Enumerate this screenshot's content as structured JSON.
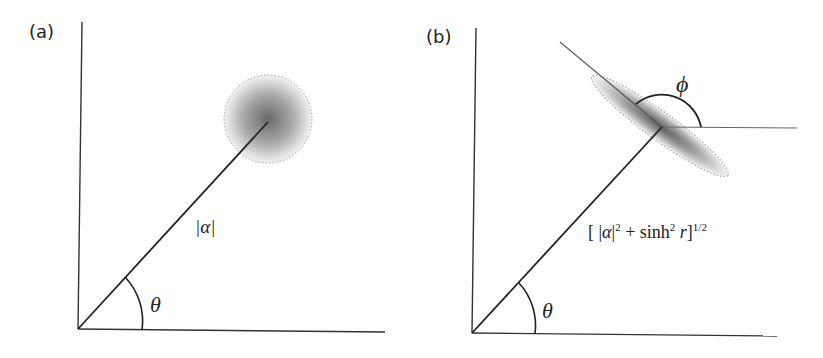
{
  "panels": [
    {
      "id": "a",
      "label": "(a)",
      "vector_label": "|α|",
      "angle_label": "θ",
      "state": "coherent state",
      "uncertainty_shape": "circle"
    },
    {
      "id": "b",
      "label": "(b)",
      "vector_label_parts": {
        "open": "[ |",
        "alpha": "α",
        "close_abs": "|",
        "sup2a": "2",
        "plus": " + sinh",
        "sup2b": "2",
        "r": " r",
        "close": "]",
        "sup_half": "1/2"
      },
      "vector_label_full": "[|α|² + sinh² r]^(1/2)",
      "angle_label": "θ",
      "phase_label": "ϕ",
      "state": "squeezed state",
      "uncertainty_shape": "ellipse"
    }
  ],
  "colors": {
    "line": "#222222",
    "axis": "#333333",
    "blob_center": "#6e6e6e",
    "dotted_border": "#9a9a9a"
  }
}
